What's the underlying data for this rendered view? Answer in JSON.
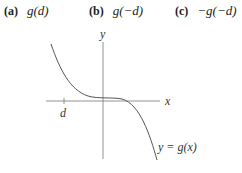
{
  "options": [
    {
      "label": "(a)",
      "expr": "g(d)"
    },
    {
      "label": "(b)",
      "expr": "g(−d)"
    },
    {
      "label": "(c)",
      "expr": "−g(−d)"
    }
  ],
  "graph": {
    "x_axis_label": "x",
    "y_axis_label": "y",
    "tick_label": "d",
    "curve_label": "y = g(x)",
    "curve_color": "#555555",
    "axis_color": "#777777"
  }
}
